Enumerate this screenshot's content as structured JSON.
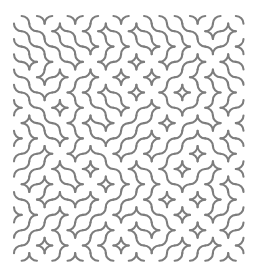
{
  "figure": {
    "kind": "truchet-arc-maze",
    "canvas": {
      "width": 258,
      "height": 280,
      "background_color": "#ffffff"
    },
    "pattern": {
      "origin_x": 14,
      "origin_y": 16,
      "cell_size": 15.3,
      "columns": 15,
      "rows": 16,
      "stroke_color": "#7d7d7d",
      "stroke_width": 2.1,
      "stroke_linecap": "round",
      "arc_radius_ratio": 0.5,
      "tile_variants": [
        "nw-se",
        "ne-sw"
      ],
      "seed": 20240517,
      "fill": "none"
    },
    "bounds": {
      "left": 14,
      "top": 16,
      "right": 243,
      "bottom": 262
    }
  }
}
